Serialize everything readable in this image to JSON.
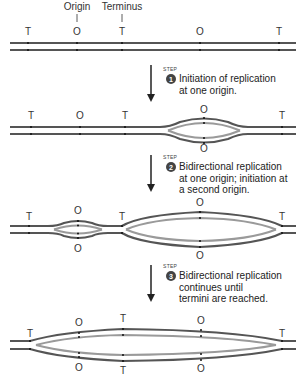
{
  "header_labels": {
    "origin": "Origin",
    "terminus": "Terminus"
  },
  "marker_labels": {
    "terminus": "T",
    "origin": "O"
  },
  "steps": [
    {
      "word": "STEP",
      "number": "1",
      "lines": [
        "Initiation of replication",
        "at one origin."
      ]
    },
    {
      "word": "STEP",
      "number": "2",
      "lines": [
        "Bidirectional replication",
        "at one origin; initiation at",
        "a second origin."
      ]
    },
    {
      "word": "STEP",
      "number": "3",
      "lines": [
        "Bidirectional replication",
        "continues until",
        "termini are reached."
      ]
    }
  ],
  "colors": {
    "parental_strand": "#555555",
    "new_strand": "#9a9a9a",
    "badge": "#444444",
    "arrow": "#222222"
  },
  "diagram_stages": [
    {
      "stage": 0,
      "description": "Unreplicated circular chromosome drawn linear",
      "markers": [
        "T",
        "O",
        "T",
        "O",
        "T"
      ]
    },
    {
      "stage": 1,
      "description": "One replication bubble at right origin",
      "markers": [
        "T",
        "O",
        "T",
        "O/O",
        "T"
      ]
    },
    {
      "stage": 2,
      "description": "Small bubble at left origin, large bubble spanning T to T",
      "markers": [
        "T",
        "O/O",
        "T",
        "O/O",
        "T"
      ]
    },
    {
      "stage": 3,
      "description": "Single large bubble spanning full length",
      "markers": [
        "T",
        "O/O",
        "T/T",
        "O/O",
        "T"
      ]
    }
  ]
}
